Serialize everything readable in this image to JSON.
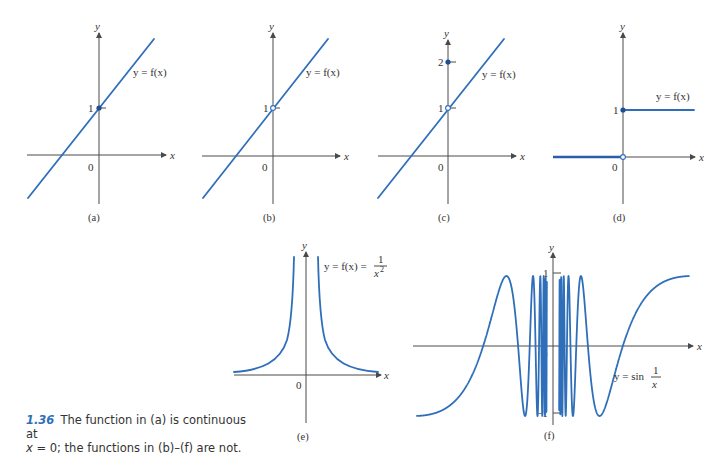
{
  "figure": {
    "panels": [
      {
        "id": "a",
        "label": "(a)",
        "function_label": "y = f(x)",
        "y_tick_labels": [
          "1"
        ],
        "origin_label": "0",
        "x_axis_label": "x",
        "y_axis_label": "y",
        "discontinuity": "none",
        "point_at_0": {
          "y": 1,
          "style": "filled"
        }
      },
      {
        "id": "b",
        "label": "(b)",
        "function_label": "y = f(x)",
        "y_tick_labels": [
          "1"
        ],
        "origin_label": "0",
        "x_axis_label": "x",
        "y_axis_label": "y",
        "discontinuity": "removable (hole at 0,1; undefined at 0)",
        "point_at_0": {
          "y": 1,
          "style": "open"
        }
      },
      {
        "id": "c",
        "label": "(c)",
        "function_label": "y = f(x)",
        "y_tick_labels": [
          "1",
          "2"
        ],
        "origin_label": "0",
        "x_axis_label": "x",
        "y_axis_label": "y",
        "discontinuity": "removable (f(0)=2, limit=1)",
        "point_at_0": {
          "y": 2,
          "style": "filled"
        },
        "hole": {
          "y": 1,
          "style": "open"
        }
      },
      {
        "id": "d",
        "label": "(d)",
        "function_label": "y = f(x)",
        "y_tick_labels": [
          "1"
        ],
        "origin_label": "0",
        "x_axis_label": "x",
        "y_axis_label": "y",
        "discontinuity": "jump (0 for x<0, 1 for x>=0)",
        "point_at_0": {
          "y": 1,
          "style": "filled"
        },
        "hole": {
          "y": 0,
          "style": "open"
        }
      },
      {
        "id": "e",
        "label": "(e)",
        "function_label_prefix": "y = f(x) =",
        "function_fraction": {
          "numerator": "1",
          "denominator": "x",
          "exponent": "2"
        },
        "origin_label": "0",
        "x_axis_label": "x",
        "y_axis_label": "y",
        "discontinuity": "infinite"
      },
      {
        "id": "f",
        "label": "(f)",
        "function_label_prefix": "y = sin",
        "function_fraction": {
          "numerator": "1",
          "denominator": "x"
        },
        "y_tick_labels": [
          "1",
          "−1"
        ],
        "origin_label": "0",
        "x_axis_label": "x",
        "y_axis_label": "y",
        "discontinuity": "oscillating"
      }
    ],
    "caption": {
      "number": "1.36",
      "text_line1": "The function in (a) is continuous at",
      "text_line2_var": "x",
      "text_line2_rest": " = 0; the functions in (b)–(f) are not."
    },
    "colors": {
      "curve": "#2f6fba",
      "axis": "#4a4a4a",
      "caption_number": "#2f6fba",
      "text": "#333333"
    }
  },
  "chart_data": [
    {
      "type": "line",
      "title": "(a)",
      "series": [
        {
          "name": "y = f(x)",
          "x": [
            -1.5,
            1.3
          ],
          "y": [
            -0.8,
            1.95
          ]
        }
      ],
      "xlabel": "x",
      "ylabel": "y",
      "yticks": [
        1
      ],
      "note": "continuous at x = 0, f(0)=1 (filled dot)"
    },
    {
      "type": "line",
      "title": "(b)",
      "series": [
        {
          "name": "y = f(x)",
          "x": [
            -1.5,
            1.3
          ],
          "y": [
            -0.8,
            1.95
          ]
        }
      ],
      "xlabel": "x",
      "ylabel": "y",
      "yticks": [
        1
      ],
      "note": "hole at (0,1)"
    },
    {
      "type": "line",
      "title": "(c)",
      "series": [
        {
          "name": "y = f(x)",
          "x": [
            -1.5,
            1.3
          ],
          "y": [
            -0.8,
            1.95
          ]
        }
      ],
      "xlabel": "x",
      "ylabel": "y",
      "yticks": [
        1,
        2
      ],
      "note": "hole at (0,1), filled point at (0,2)"
    },
    {
      "type": "line",
      "title": "(d)",
      "series": [
        {
          "name": "y = f(x), x<0",
          "x": [
            -1.5,
            0
          ],
          "y": [
            0,
            0
          ]
        },
        {
          "name": "y = f(x), x>=0",
          "x": [
            0,
            1.5
          ],
          "y": [
            1,
            1
          ]
        }
      ],
      "xlabel": "x",
      "ylabel": "y",
      "yticks": [
        1
      ],
      "note": "open dot at (0,0), filled dot at (0,1)"
    },
    {
      "type": "line",
      "title": "(e)",
      "series": [
        {
          "name": "y = f(x) = 1/x^2",
          "function": "1/x^2"
        }
      ],
      "xlabel": "x",
      "ylabel": "y",
      "note": "vertical asymptote at x = 0"
    },
    {
      "type": "line",
      "title": "(f)",
      "series": [
        {
          "name": "y = sin(1/x)",
          "function": "sin(1/x)"
        }
      ],
      "xlabel": "x",
      "ylabel": "y",
      "yticks": [
        -1,
        1
      ],
      "ylim": [
        -1,
        1
      ]
    }
  ]
}
